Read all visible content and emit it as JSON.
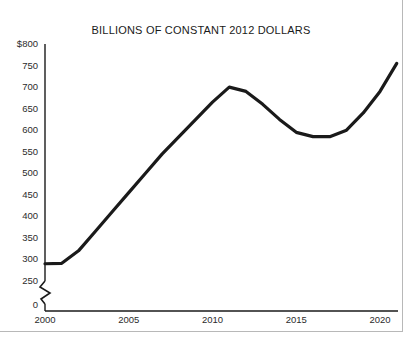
{
  "chart_data": {
    "type": "line",
    "title": "BILLIONS OF CONSTANT 2012 DOLLARS",
    "xlabel": "",
    "ylabel": "",
    "xlim": [
      2000,
      2021.5
    ],
    "ylim": [
      250,
      800
    ],
    "yaxis_break": true,
    "yaxis_break_label": "0",
    "grid": false,
    "legend": null,
    "ytick_labels": [
      "$800",
      "750",
      "700",
      "650",
      "600",
      "550",
      "500",
      "450",
      "400",
      "350",
      "300",
      "250"
    ],
    "ytick_values": [
      800,
      750,
      700,
      650,
      600,
      550,
      500,
      450,
      400,
      350,
      300,
      250
    ],
    "xtick_labels": [
      "2000",
      "2005",
      "2010",
      "2015",
      "2020"
    ],
    "xtick_values": [
      2000,
      2005,
      2010,
      2015,
      2020
    ],
    "line_color": "#1a1a1a",
    "line_width": 3.2,
    "x": [
      2000,
      2001,
      2002,
      2003,
      2004,
      2005,
      2006,
      2007,
      2008,
      2009,
      2010,
      2011,
      2012,
      2013,
      2014,
      2015,
      2016,
      2017,
      2018,
      2019,
      2020,
      2021
    ],
    "values": [
      290,
      291,
      320,
      365,
      410,
      455,
      500,
      545,
      585,
      625,
      665,
      700,
      690,
      660,
      625,
      595,
      585,
      585,
      600,
      640,
      690,
      755
    ],
    "series": [
      {
        "name": "Billions of constant 2012 dollars",
        "values": [
          290,
          291,
          320,
          365,
          410,
          455,
          500,
          545,
          585,
          625,
          665,
          700,
          690,
          660,
          625,
          595,
          585,
          585,
          600,
          640,
          690,
          755
        ]
      }
    ],
    "annotations": []
  }
}
